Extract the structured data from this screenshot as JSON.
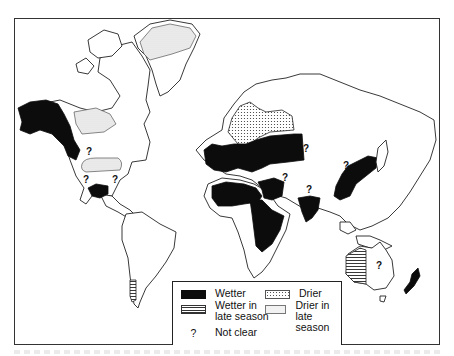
{
  "figure": {
    "type": "world map"
  },
  "legend": {
    "items": [
      {
        "key": "wetter",
        "label": "Wetter",
        "pattern": "solid-black"
      },
      {
        "key": "drier",
        "label": "Drier",
        "pattern": "dots"
      },
      {
        "key": "wetter_late",
        "label": "Wetter in late season",
        "line1": "Wetter in",
        "line2": "late season",
        "pattern": "horizontal-stripes"
      },
      {
        "key": "drier_late",
        "label": "Drier in late season",
        "line1": "Drier in",
        "line2": "late season",
        "pattern": "light-stipple"
      },
      {
        "key": "not_clear",
        "symbol": "?",
        "label": "Not clear"
      }
    ]
  },
  "regions": {
    "wetter": [
      "Alaska and NW Canada Pacific coast",
      "Northern Mexico",
      "Europe and Western Russia",
      "North Africa Mediterranean coast",
      "Sahel and East Africa",
      "Middle East / Arabian Peninsula edge",
      "India",
      "East China, Korea and Japan",
      "New Zealand"
    ],
    "drier": [
      "Scandinavia and NW Russia"
    ],
    "wetter_late_season": [
      "Western Australia",
      "Southern Chile"
    ],
    "drier_late_season": [
      "Northern Canada",
      "Greenland interior",
      "US Midwest / Great Plains"
    ],
    "not_clear": [
      "Western Canada interior",
      "US Southwest",
      "US Southeast",
      "Central Siberia",
      "Central Asia",
      "Arabian Sea region",
      "Northern China",
      "Central Australia"
    ]
  },
  "question_mark": "?"
}
